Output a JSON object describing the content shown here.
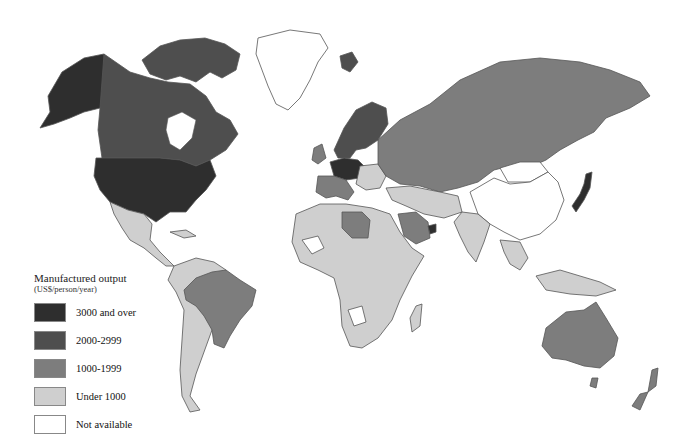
{
  "caption": "",
  "legend": {
    "title": "Manufactured output",
    "subtitle": "(US$/person/year)",
    "items": [
      {
        "label": "3000 and over",
        "color": "#2e2e2e"
      },
      {
        "label": "2000-2999",
        "color": "#4e4e4e"
      },
      {
        "label": "1000-1999",
        "color": "#7d7d7d"
      },
      {
        "label": "Under 1000",
        "color": "#cfcfcf"
      },
      {
        "label": "Not available",
        "color": "#ffffff"
      }
    ]
  },
  "regions": {
    "alaska_usa": "3000 and over",
    "canada": "2000-2999",
    "greenland": "Not available",
    "mexico_central_america": "Under 1000",
    "brazil": "1000-1999",
    "south_america_other": "Under 1000",
    "western_europe_core": "3000 and over",
    "scandinavia": "2000-2999",
    "ussr": "1000-1999",
    "china": "Not available",
    "mongolia": "Not available",
    "japan": "3000 and over",
    "libya": "1000-1999",
    "saudi_arabia": "1000-1999",
    "uae": "3000 and over",
    "africa_most": "Under 1000",
    "india": "Under 1000",
    "southeast_asia": "Under 1000",
    "australia": "1000-1999",
    "new_zealand": "1000-1999"
  }
}
